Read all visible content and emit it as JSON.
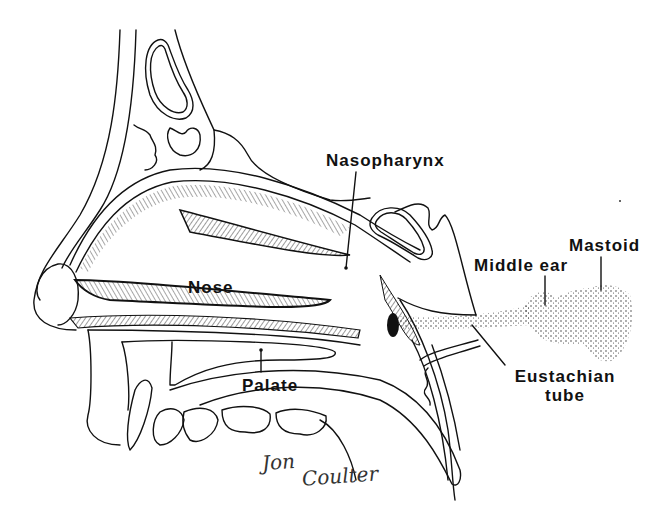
{
  "figure": {
    "colors": {
      "ink": "#111111",
      "paper": "#ffffff",
      "stipple": "#333333"
    },
    "labels": [
      {
        "id": "nasopharynx",
        "text": "Nasopharynx",
        "x": 326,
        "y": 152
      },
      {
        "id": "mastoid",
        "text": "Mastoid",
        "x": 569,
        "y": 237
      },
      {
        "id": "middle-ear",
        "text": "Middle ear",
        "x": 474,
        "y": 257
      },
      {
        "id": "nose",
        "text": "Nose",
        "x": 188,
        "y": 279
      },
      {
        "id": "palate",
        "text": "Palate",
        "x": 242,
        "y": 377
      },
      {
        "id": "eustachian-tube",
        "text": "Eustachian",
        "text2": "tube",
        "x": 508,
        "y": 368
      }
    ],
    "signature": {
      "first": "Jon",
      "last": "Coulter"
    }
  }
}
